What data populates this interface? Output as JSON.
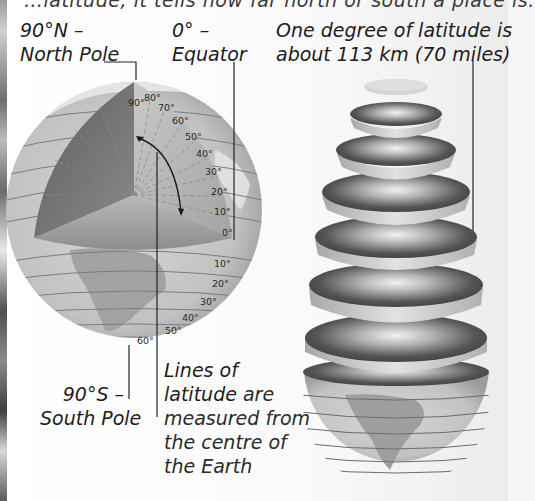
{
  "top_cutoff_text": "…latitude; it tells how far north or south a place is.",
  "labels": {
    "north_pole": {
      "line1": "90°N –",
      "line2": "North Pole"
    },
    "equator": {
      "line1": "0° –",
      "line2": "Equator"
    },
    "degree_distance": {
      "line1": "One degree of latitude is",
      "line2": "about 113 km (70 miles)"
    },
    "south_pole": {
      "line1": "90°S –",
      "line2": "South Pole"
    },
    "lines_of_latitude": {
      "line1": "Lines of",
      "line2a": "latitude",
      "line2b": " are",
      "line3": "measured from",
      "line4": "the centre of",
      "line5": "the Earth"
    }
  },
  "cutaway_angles": [
    "90°",
    "80°",
    "70°",
    "60°",
    "50°",
    "40°",
    "30°",
    "20°",
    "10°",
    "0°"
  ],
  "southern_latitudes": [
    "10°",
    "20°",
    "30°",
    "40°",
    "50°",
    "60°"
  ],
  "colors": {
    "ocean": "#c4c4c4",
    "land": "#9d9d9d",
    "cut_face_dark": "#6a6a6a",
    "slice_dark": "#4e4e4e",
    "text": "#1c1c1c",
    "leader_line": "#222222"
  }
}
